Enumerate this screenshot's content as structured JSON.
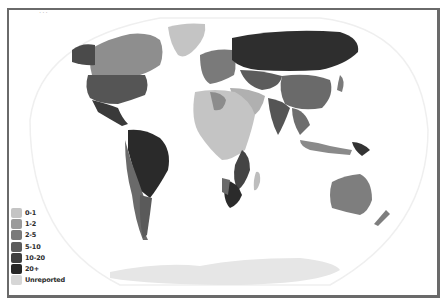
{
  "map": {
    "caption": "...",
    "colors": {
      "border": "#6a6a6a",
      "ocean": "#ffffff",
      "graticule": "#ececec",
      "antarctica": "#ececec"
    },
    "legend": {
      "items": [
        {
          "label": "0-1",
          "color": "#c4c4c4"
        },
        {
          "label": "1-2",
          "color": "#9a9a9a"
        },
        {
          "label": "2-5",
          "color": "#7a7a7a"
        },
        {
          "label": "5-10",
          "color": "#5c5c5c"
        },
        {
          "label": "10-20",
          "color": "#3e3e3e"
        },
        {
          "label": "20+",
          "color": "#262626"
        },
        {
          "label": "Unreported",
          "color": "#d6d6d6"
        }
      ]
    }
  }
}
